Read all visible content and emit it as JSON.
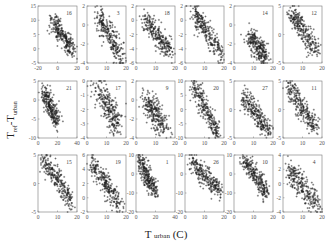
{
  "chart_data": {
    "type": "scatter",
    "title": "",
    "xlabel": "T urban (C)",
    "ylabel": "Tref-Turban",
    "layout": {
      "rows": 3,
      "cols": 6
    },
    "marker": "+",
    "marker_color": "#222222",
    "panels": [
      {
        "id": "16",
        "row": 0,
        "col": 0,
        "xlim": [
          -20,
          20
        ],
        "ylim": [
          -5,
          15
        ],
        "xticks": [
          -20,
          0,
          20
        ],
        "yticks": [
          -5,
          0,
          5,
          10,
          15
        ],
        "trend": {
          "x": [
            -5,
            15
          ],
          "y": [
            10,
            -1
          ]
        },
        "spread": 0.18
      },
      {
        "id": "3",
        "row": 0,
        "col": 1,
        "xlim": [
          0,
          20
        ],
        "ylim": [
          -4,
          2
        ],
        "xticks": [
          0,
          10,
          20
        ],
        "yticks": [
          -4,
          -2,
          0,
          2
        ],
        "trend": {
          "x": [
            6,
            18
          ],
          "y": [
            1,
            -3.5
          ]
        },
        "spread": 0.22
      },
      {
        "id": "18",
        "row": 0,
        "col": 2,
        "xlim": [
          0,
          20
        ],
        "ylim": [
          -6,
          2
        ],
        "xticks": [
          0,
          10,
          20
        ],
        "yticks": [
          -6,
          -4,
          -2,
          0,
          2
        ],
        "trend": {
          "x": [
            4,
            18
          ],
          "y": [
            0,
            -4.5
          ]
        },
        "spread": 0.2
      },
      {
        "id": "",
        "row": 0,
        "col": 3,
        "xlim": [
          0,
          20
        ],
        "ylim": [
          -6,
          2
        ],
        "xticks": [
          0,
          10,
          20
        ],
        "yticks": [
          -6,
          -4,
          -2,
          0,
          2
        ],
        "trend": {
          "x": [
            4,
            19
          ],
          "y": [
            1.5,
            -5
          ]
        },
        "spread": 0.2
      },
      {
        "id": "14",
        "row": 0,
        "col": 4,
        "xlim": [
          0,
          20
        ],
        "ylim": [
          -4,
          2
        ],
        "xticks": [
          0,
          10,
          20
        ],
        "yticks": [
          -4,
          -2,
          0,
          2
        ],
        "trend": {
          "x": [
            8,
            16
          ],
          "y": [
            -1,
            -3.5
          ]
        },
        "spread": 0.22
      },
      {
        "id": "12",
        "row": 0,
        "col": 5,
        "xlim": [
          0,
          20
        ],
        "ylim": [
          -5,
          5
        ],
        "xticks": [
          0,
          10,
          20
        ],
        "yticks": [
          -5,
          0,
          5
        ],
        "trend": {
          "x": [
            4,
            17
          ],
          "y": [
            4,
            -3
          ]
        },
        "spread": 0.2
      },
      {
        "id": "21",
        "row": 1,
        "col": 0,
        "xlim": [
          0,
          40
        ],
        "ylim": [
          -10,
          5
        ],
        "xticks": [
          0,
          20,
          40
        ],
        "yticks": [
          -10,
          -5,
          0,
          5
        ],
        "trend": {
          "x": [
            6,
            20
          ],
          "y": [
            2,
            -6
          ]
        },
        "spread": 0.18
      },
      {
        "id": "17",
        "row": 1,
        "col": 1,
        "xlim": [
          0,
          20
        ],
        "ylim": [
          -4,
          0
        ],
        "xticks": [
          0,
          10,
          20
        ],
        "yticks": [
          -4,
          -3,
          -2,
          -1,
          0
        ],
        "trend": {
          "x": [
            6,
            16
          ],
          "y": [
            -0.5,
            -3.2
          ]
        },
        "spread": 0.26
      },
      {
        "id": "9",
        "row": 1,
        "col": 2,
        "xlim": [
          0,
          20
        ],
        "ylim": [
          -4,
          2
        ],
        "xticks": [
          0,
          10,
          20
        ],
        "yticks": [
          -4,
          -2,
          0,
          2
        ],
        "trend": {
          "x": [
            5,
            15
          ],
          "y": [
            0,
            -3
          ]
        },
        "spread": 0.24
      },
      {
        "id": "20",
        "row": 1,
        "col": 3,
        "xlim": [
          0,
          20
        ],
        "ylim": [
          -10,
          10
        ],
        "xticks": [
          0,
          10,
          20
        ],
        "yticks": [
          -10,
          -5,
          0,
          5,
          10
        ],
        "trend": {
          "x": [
            4,
            17
          ],
          "y": [
            9,
            -9
          ]
        },
        "spread": 0.18
      },
      {
        "id": "27",
        "row": 1,
        "col": 4,
        "xlim": [
          0,
          20
        ],
        "ylim": [
          -5,
          5
        ],
        "xticks": [
          0,
          10,
          20
        ],
        "yticks": [
          -5,
          0,
          5
        ],
        "trend": {
          "x": [
            5,
            18
          ],
          "y": [
            2.5,
            -4
          ]
        },
        "spread": 0.2
      },
      {
        "id": "11",
        "row": 1,
        "col": 5,
        "xlim": [
          0,
          20
        ],
        "ylim": [
          -5,
          5
        ],
        "xticks": [
          0,
          10,
          20
        ],
        "yticks": [
          -5,
          0,
          5
        ],
        "trend": {
          "x": [
            3,
            17
          ],
          "y": [
            4,
            -3.5
          ]
        },
        "spread": 0.2
      },
      {
        "id": "15",
        "row": 2,
        "col": 0,
        "xlim": [
          0,
          20
        ],
        "ylim": [
          -5,
          5
        ],
        "xticks": [
          0,
          10,
          20
        ],
        "yticks": [
          -5,
          0,
          5
        ],
        "trend": {
          "x": [
            3,
            17
          ],
          "y": [
            4.5,
            -3
          ]
        },
        "spread": 0.2
      },
      {
        "id": "19",
        "row": 2,
        "col": 1,
        "xlim": [
          0,
          20
        ],
        "ylim": [
          -2,
          6
        ],
        "xticks": [
          0,
          10,
          20
        ],
        "yticks": [
          -2,
          0,
          2,
          4,
          6
        ],
        "trend": {
          "x": [
            2,
            17
          ],
          "y": [
            5,
            -1
          ]
        },
        "spread": 0.2
      },
      {
        "id": "1",
        "row": 2,
        "col": 2,
        "xlim": [
          0,
          40
        ],
        "ylim": [
          -20,
          10
        ],
        "xticks": [
          0,
          20,
          40
        ],
        "yticks": [
          -20,
          -10,
          0,
          10
        ],
        "trend": {
          "x": [
            3,
            20
          ],
          "y": [
            8,
            -10
          ]
        },
        "spread": 0.16
      },
      {
        "id": "26",
        "row": 2,
        "col": 3,
        "xlim": [
          0,
          20
        ],
        "ylim": [
          -20,
          10
        ],
        "xticks": [
          0,
          10,
          20
        ],
        "yticks": [
          -20,
          -10,
          0,
          10
        ],
        "trend": {
          "x": [
            3,
            18
          ],
          "y": [
            8,
            -10
          ]
        },
        "spread": 0.18
      },
      {
        "id": "10",
        "row": 2,
        "col": 4,
        "xlim": [
          0,
          20
        ],
        "ylim": [
          -20,
          10
        ],
        "xticks": [
          0,
          10,
          20
        ],
        "yticks": [
          -20,
          -10,
          0,
          10
        ],
        "trend": {
          "x": [
            5,
            17
          ],
          "y": [
            8,
            -10
          ]
        },
        "spread": 0.18
      },
      {
        "id": "4",
        "row": 2,
        "col": 5,
        "xlim": [
          0,
          20
        ],
        "ylim": [
          -4,
          4
        ],
        "xticks": [
          0,
          10,
          20
        ],
        "yticks": [
          -4,
          -2,
          0,
          2,
          4
        ],
        "trend": {
          "x": [
            3,
            18
          ],
          "y": [
            2,
            -3
          ]
        },
        "spread": 0.24
      }
    ]
  },
  "labels": {
    "ylabel_main": "T",
    "ylabel_sub1": "ref",
    "ylabel_mid": "-T",
    "ylabel_sub2": "urban",
    "xlabel_main": "T",
    "xlabel_sub": "urban",
    "xlabel_unit": "(C)"
  }
}
